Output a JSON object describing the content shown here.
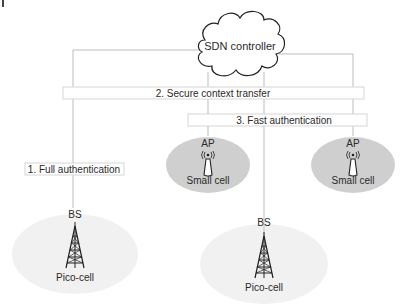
{
  "diagram": {
    "controller": {
      "label": "SDN controller"
    },
    "steps": [
      {
        "label": "1. Full authentication"
      },
      {
        "label": "2. Secure context transfer"
      },
      {
        "label": "3. Fast authentication"
      }
    ],
    "nodes": [
      {
        "id": "pico-left",
        "type_label": "BS",
        "cell_label": "Pico-cell",
        "icon": "cell-tower-icon"
      },
      {
        "id": "small-left",
        "type_label": "AP",
        "cell_label": "Small cell",
        "icon": "access-point-icon"
      },
      {
        "id": "pico-center",
        "type_label": "BS",
        "cell_label": "Pico-cell",
        "icon": "cell-tower-icon"
      },
      {
        "id": "small-right",
        "type_label": "AP",
        "cell_label": "Small cell",
        "icon": "access-point-icon"
      }
    ],
    "colors": {
      "line": "#bdbdbd",
      "box_border": "#d6d6d6",
      "small_cell_fill": "#cfcfcf",
      "pico_cell_fill": "#f1f1f1",
      "icon": "#222222"
    }
  }
}
